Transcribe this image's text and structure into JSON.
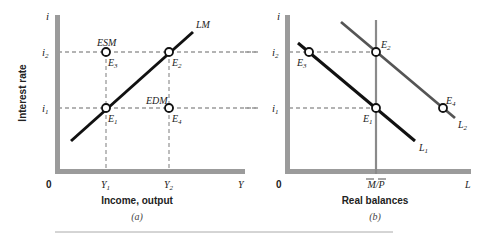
{
  "colors": {
    "axis": "#9b9b9b",
    "curve": "#111111",
    "curve_shifted": "#555555",
    "dashed": "#9a9a9a",
    "vertical_supply": "#8a8a8a",
    "text": "#222222"
  },
  "panel_a": {
    "y_axis_symbol": "i",
    "y_axis_title": "Interest rate",
    "x_axis_symbol": "Y",
    "origin_label": "0",
    "x_axis_title": "Income, output",
    "caption": "(a)",
    "y_ticks": [
      "i2",
      "i1"
    ],
    "x_ticks": [
      "Y1",
      "Y2"
    ],
    "curve_label": "LM",
    "points": {
      "E1": "E1",
      "E2": "E2",
      "E3": "E3",
      "E4": "E4"
    },
    "region_labels": {
      "esm": "ESM",
      "edm": "EDM"
    }
  },
  "panel_b": {
    "y_axis_symbol": "i",
    "x_axis_symbol": "L",
    "origin_label": "0",
    "x_axis_title": "Real balances",
    "caption": "(b)",
    "y_ticks": [
      "i2",
      "i1"
    ],
    "x_tick": "M/P",
    "curves": [
      "L1",
      "L2"
    ],
    "points": {
      "E1": "E1",
      "E2": "E2",
      "E3": "E3",
      "E4": "E4"
    }
  }
}
